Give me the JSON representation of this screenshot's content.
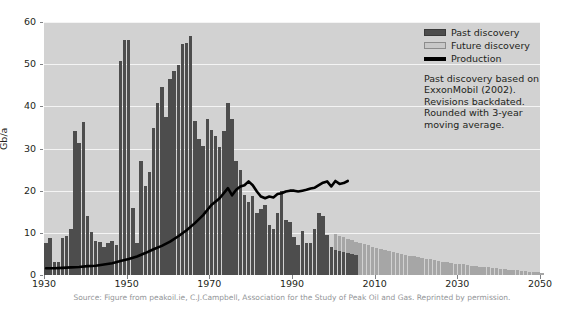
{
  "chart_data": {
    "type": "bar",
    "title": "",
    "xlabel": "",
    "ylabel": "Gb/a",
    "xlim": [
      1930,
      2050
    ],
    "ylim": [
      0,
      60
    ],
    "ytick_values": [
      0,
      10,
      20,
      30,
      40,
      50,
      60
    ],
    "xtick_values": [
      1930,
      1950,
      1970,
      1990,
      2010,
      2030,
      2050
    ],
    "grid": true,
    "legend_position": "top-right",
    "colors": {
      "past_discovery": "#4d4d4d",
      "future_discovery": "#a6a6a6",
      "production": "#000000",
      "plot_background": "#d2d2d2",
      "gridline": "#f4f4f4",
      "page_background": "#ffffff",
      "source_text": "#939598"
    },
    "legend": [
      {
        "name": "past-discovery",
        "label": "Past discovery",
        "color": "#4d4d4d",
        "marker": "bar"
      },
      {
        "name": "future-discovery",
        "label": "Future discovery",
        "color": "#c8c8c8",
        "marker": "bar"
      },
      {
        "name": "production",
        "label": "Production",
        "color": "#000000",
        "marker": "line"
      }
    ],
    "annotation": [
      "Past discovery based on",
      "ExxonMobil (2002).",
      "Revisions backdated.",
      "Rounded with 3-year",
      "moving average."
    ],
    "source": "Source: Figure from peakoil.ie, C.J.Campbell, Association for the Study of Peak Oil and Gas. Reprinted by permission.",
    "series": [
      {
        "name": "Past discovery",
        "type": "bar",
        "color": "#4d4d4d",
        "x": [
          1930,
          1931,
          1932,
          1933,
          1934,
          1935,
          1936,
          1937,
          1938,
          1939,
          1940,
          1941,
          1942,
          1943,
          1944,
          1945,
          1946,
          1947,
          1948,
          1949,
          1950,
          1951,
          1952,
          1953,
          1954,
          1955,
          1956,
          1957,
          1958,
          1959,
          1960,
          1961,
          1962,
          1963,
          1964,
          1965,
          1966,
          1967,
          1968,
          1969,
          1970,
          1971,
          1972,
          1973,
          1974,
          1975,
          1976,
          1977,
          1978,
          1979,
          1980,
          1981,
          1982,
          1983,
          1984,
          1985,
          1986,
          1987,
          1988,
          1989,
          1990,
          1991,
          1992,
          1993,
          1994,
          1995,
          1996,
          1997,
          1998,
          1999,
          2000,
          2001,
          2002,
          2003,
          2004,
          2005
        ],
        "values": [
          7.5,
          8.8,
          3.0,
          3.2,
          8.8,
          9.2,
          10.8,
          34.2,
          31.3,
          36.2,
          14.0,
          10.3,
          8.0,
          7.8,
          6.6,
          7.7,
          8.0,
          7.2,
          50.8,
          55.8,
          55.8,
          15.9,
          7.5,
          27.0,
          21.1,
          24.5,
          34.8,
          40.9,
          44.6,
          37.5,
          46.5,
          48.5,
          49.7,
          54.8,
          55.0,
          56.8,
          36.5,
          32.3,
          30.5,
          37.0,
          34.3,
          33.0,
          30.4,
          34.2,
          40.7,
          37.0,
          27.0,
          25.0,
          19.0,
          17.3,
          18.8,
          14.6,
          15.6,
          16.5,
          11.9,
          11.0,
          14.8,
          20.0,
          13.0,
          12.6,
          9.0,
          7.2,
          10.5,
          7.5,
          7.7,
          11.0,
          14.6,
          13.9,
          9.5,
          6.7,
          6.0,
          5.8,
          5.4,
          5.2,
          5.0,
          4.8
        ]
      },
      {
        "name": "Future discovery",
        "type": "bar",
        "color": "#a6a6a6",
        "x": [
          2000,
          2001,
          2002,
          2003,
          2004,
          2005,
          2006,
          2007,
          2008,
          2009,
          2010,
          2011,
          2012,
          2013,
          2014,
          2015,
          2016,
          2017,
          2018,
          2019,
          2020,
          2021,
          2022,
          2023,
          2024,
          2025,
          2026,
          2027,
          2028,
          2029,
          2030,
          2031,
          2032,
          2033,
          2034,
          2035,
          2036,
          2037,
          2038,
          2039,
          2040,
          2041,
          2042,
          2043,
          2044,
          2045,
          2046,
          2047,
          2048,
          2049,
          2050
        ],
        "values": [
          9.8,
          9.3,
          8.9,
          8.5,
          8.2,
          7.9,
          7.6,
          7.3,
          7.0,
          6.7,
          6.4,
          6.1,
          5.9,
          5.6,
          5.4,
          5.2,
          5.0,
          4.8,
          4.6,
          4.4,
          4.2,
          4.0,
          3.8,
          3.7,
          3.5,
          3.3,
          3.2,
          3.0,
          2.9,
          2.7,
          2.6,
          2.5,
          2.3,
          2.2,
          2.1,
          2.0,
          1.9,
          1.8,
          1.7,
          1.6,
          1.5,
          1.4,
          1.3,
          1.2,
          1.1,
          1.0,
          0.9,
          0.8,
          0.7,
          0.6,
          0.5
        ]
      },
      {
        "name": "Production",
        "type": "line",
        "color": "#000000",
        "x": [
          1930,
          1932,
          1934,
          1936,
          1938,
          1940,
          1942,
          1944,
          1946,
          1948,
          1950,
          1952,
          1954,
          1956,
          1958,
          1960,
          1962,
          1964,
          1966,
          1968,
          1970,
          1972,
          1974,
          1975,
          1976,
          1977,
          1978,
          1979,
          1980,
          1981,
          1982,
          1983,
          1984,
          1985,
          1986,
          1987,
          1988,
          1989,
          1990,
          1991,
          1992,
          1993,
          1994,
          1995,
          1996,
          1997,
          1998,
          1999,
          2000,
          2001,
          2002,
          2003
        ],
        "values": [
          1.6,
          1.6,
          1.7,
          1.8,
          1.9,
          2.1,
          2.2,
          2.5,
          2.8,
          3.3,
          3.8,
          4.4,
          5.2,
          6.1,
          6.9,
          7.9,
          9.2,
          10.6,
          12.3,
          14.2,
          16.6,
          18.2,
          20.6,
          18.9,
          20.2,
          21.0,
          21.3,
          22.2,
          21.3,
          19.8,
          18.6,
          18.2,
          18.6,
          18.4,
          19.2,
          19.4,
          19.8,
          20.0,
          20.0,
          19.8,
          20.0,
          20.2,
          20.5,
          20.7,
          21.3,
          21.9,
          22.2,
          21.0,
          22.3,
          21.6,
          21.8,
          22.3
        ]
      }
    ]
  }
}
